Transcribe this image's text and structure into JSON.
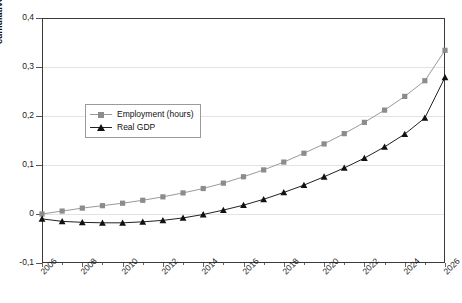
{
  "chart_data": {
    "type": "line",
    "title": "",
    "xlabel": "",
    "ylabel": "cumulative % deviation from base case",
    "xlim": [
      2006,
      2026
    ],
    "ylim": [
      -0.1,
      0.4
    ],
    "yticks": [
      "0,4",
      "0,3",
      "0,2",
      "0,1",
      "0",
      "-0,1"
    ],
    "ytick_values": [
      0.4,
      0.3,
      0.2,
      0.1,
      0,
      -0.1
    ],
    "xticks": [
      "2006",
      "2008",
      "2010",
      "2012",
      "2014",
      "2016",
      "2018",
      "2020",
      "2022",
      "2024",
      "2026"
    ],
    "xtick_values": [
      2006,
      2008,
      2010,
      2012,
      2014,
      2016,
      2018,
      2020,
      2022,
      2024,
      2026
    ],
    "x": [
      2006,
      2007,
      2008,
      2009,
      2010,
      2011,
      2012,
      2013,
      2014,
      2015,
      2016,
      2017,
      2018,
      2019,
      2020,
      2021,
      2022,
      2023,
      2024,
      2025,
      2026
    ],
    "grid": true,
    "legend_position": "upper-left-inside",
    "decimal_separator": ",",
    "series": [
      {
        "name": "Employment (hours)",
        "marker": "square",
        "color": "#8c8c8c",
        "line_color": "#9a9a9a",
        "values": [
          0.0,
          0.006,
          0.012,
          0.017,
          0.022,
          0.028,
          0.035,
          0.043,
          0.052,
          0.063,
          0.076,
          0.09,
          0.106,
          0.124,
          0.143,
          0.164,
          0.187,
          0.212,
          0.24,
          0.272,
          0.334
        ]
      },
      {
        "name": "Real GDP",
        "marker": "triangle",
        "color": "#111111",
        "line_color": "#222222",
        "values": [
          -0.01,
          -0.015,
          -0.017,
          -0.018,
          -0.018,
          -0.016,
          -0.013,
          -0.008,
          -0.001,
          0.008,
          0.018,
          0.03,
          0.044,
          0.059,
          0.076,
          0.094,
          0.114,
          0.137,
          0.163,
          0.196,
          0.279
        ]
      }
    ]
  },
  "legend": {
    "items": [
      {
        "label": "Employment (hours)"
      },
      {
        "label": "Real GDP"
      }
    ]
  }
}
